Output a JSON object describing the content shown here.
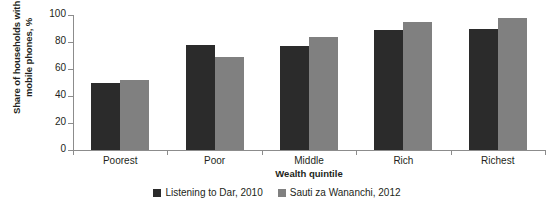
{
  "chart_data": {
    "type": "bar",
    "title": "",
    "subtitle": "",
    "xlabel": "Wealth quintile",
    "ylabel": "Share of households with\nmobile phones, %",
    "categories": [
      "Poorest",
      "Poor",
      "Middle",
      "Rich",
      "Richest"
    ],
    "series": [
      {
        "name": "Listening to Dar, 2010",
        "color": "#2b2b2b",
        "values": [
          50,
          78,
          77,
          89,
          90
        ]
      },
      {
        "name": "Sauti za Wananchi, 2012",
        "color": "#808080",
        "values": [
          52,
          69,
          84,
          95,
          98
        ]
      }
    ],
    "ylim": [
      0,
      100
    ],
    "yticks": [
      0,
      20,
      40,
      60,
      80,
      100
    ],
    "ytick_labels": [
      "0",
      "20",
      "40",
      "60",
      "80",
      "100"
    ],
    "grid": false,
    "legend_position": "bottom"
  },
  "axis": {
    "y_title": "Share of households with\nmobile phones, %",
    "x_title": "Wealth quintile"
  },
  "legend": {
    "items": [
      {
        "label": "Listening to Dar, 2010",
        "color": "#2b2b2b"
      },
      {
        "label": "Sauti za Wananchi, 2012",
        "color": "#808080"
      }
    ]
  }
}
